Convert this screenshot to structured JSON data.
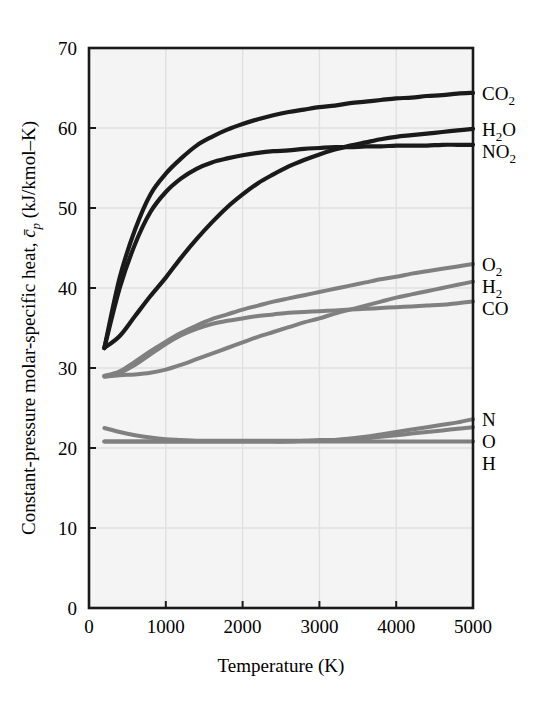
{
  "figure": {
    "background_color": "#ffffff",
    "plot_background_color": "#f4f4f4",
    "grid_color": "#e0e0e0",
    "axis_color": "#1a1a1a",
    "dark_series_color": "#1a1a1a",
    "gray_series_color": "#808080"
  },
  "axes": {
    "x_title": "Temperature (K)",
    "y_title_part1": "Constant-pressure molar-specific heat, ",
    "y_title_symbol": "c̄",
    "y_title_sub": "p",
    "y_title_part2": " (kJ/kmol–K)",
    "x_ticks": [
      "0",
      "1000",
      "2000",
      "3000",
      "4000",
      "5000"
    ],
    "y_ticks": [
      "0",
      "10",
      "20",
      "30",
      "40",
      "50",
      "60",
      "70"
    ]
  },
  "chart_data": {
    "type": "line",
    "title": "",
    "xlabel": "Temperature (K)",
    "ylabel": "Constant-pressure molar-specific heat, c̄p (kJ/kmol–K)",
    "xlim": [
      0,
      5000
    ],
    "ylim": [
      0,
      70
    ],
    "grid": true,
    "legend_position": "right-inline-labels",
    "x": [
      200,
      400,
      600,
      800,
      1000,
      1200,
      1400,
      1600,
      1800,
      2000,
      2200,
      2400,
      2600,
      2800,
      3000,
      3200,
      3400,
      3600,
      3800,
      4000,
      4200,
      4400,
      4600,
      4800,
      5000
    ],
    "series": [
      {
        "name": "CO2",
        "label": "CO",
        "label_sub": "2",
        "color": "#1a1a1a",
        "values": [
          32.5,
          41.3,
          47.3,
          51.7,
          54.3,
          56.2,
          57.8,
          58.9,
          59.8,
          60.5,
          61.1,
          61.6,
          62.0,
          62.3,
          62.6,
          62.8,
          63.1,
          63.3,
          63.5,
          63.7,
          63.8,
          64.0,
          64.1,
          64.3,
          64.4
        ]
      },
      {
        "name": "H2O",
        "label": "H",
        "label_sub": "2",
        "label_tail": "O",
        "color": "#1a1a1a",
        "values": [
          32.5,
          34.0,
          36.5,
          39.0,
          41.3,
          43.8,
          46.1,
          48.2,
          50.1,
          51.7,
          53.1,
          54.2,
          55.2,
          56.0,
          56.7,
          57.3,
          57.8,
          58.2,
          58.6,
          58.9,
          59.1,
          59.3,
          59.5,
          59.7,
          59.9
        ]
      },
      {
        "name": "NO2",
        "label": "NO",
        "label_sub": "2",
        "color": "#1a1a1a",
        "values": [
          32.5,
          40.0,
          45.5,
          49.5,
          52.0,
          53.7,
          54.9,
          55.7,
          56.2,
          56.6,
          56.9,
          57.1,
          57.2,
          57.4,
          57.5,
          57.6,
          57.6,
          57.7,
          57.7,
          57.8,
          57.8,
          57.8,
          57.9,
          57.9,
          57.9
        ]
      },
      {
        "name": "O2",
        "label": "O",
        "label_sub": "2",
        "color": "#808080",
        "values": [
          29.0,
          29.6,
          30.8,
          32.1,
          33.3,
          34.4,
          35.3,
          36.1,
          36.7,
          37.3,
          37.8,
          38.3,
          38.7,
          39.1,
          39.5,
          39.9,
          40.3,
          40.7,
          41.1,
          41.4,
          41.8,
          42.1,
          42.4,
          42.7,
          43.0
        ]
      },
      {
        "name": "H2",
        "label": "H",
        "label_sub": "2",
        "color": "#808080",
        "values": [
          28.9,
          29.1,
          29.2,
          29.4,
          29.8,
          30.4,
          31.1,
          31.8,
          32.5,
          33.2,
          33.9,
          34.5,
          35.1,
          35.7,
          36.2,
          36.8,
          37.3,
          37.8,
          38.3,
          38.8,
          39.2,
          39.6,
          40.0,
          40.4,
          40.8
        ]
      },
      {
        "name": "CO",
        "label": "CO",
        "color": "#808080",
        "values": [
          29.0,
          29.4,
          30.4,
          31.7,
          33.0,
          34.1,
          34.9,
          35.5,
          35.9,
          36.2,
          36.5,
          36.7,
          36.9,
          37.0,
          37.1,
          37.2,
          37.3,
          37.4,
          37.5,
          37.6,
          37.7,
          37.8,
          37.9,
          38.1,
          38.3
        ]
      },
      {
        "name": "N",
        "label": "N",
        "color": "#808080",
        "values": [
          20.8,
          20.8,
          20.8,
          20.8,
          20.8,
          20.8,
          20.8,
          20.8,
          20.8,
          20.8,
          20.8,
          20.8,
          20.8,
          20.9,
          20.9,
          21.0,
          21.2,
          21.4,
          21.7,
          22.0,
          22.3,
          22.6,
          22.9,
          23.2,
          23.6
        ]
      },
      {
        "name": "O",
        "label": "O",
        "color": "#808080",
        "values": [
          22.5,
          22.0,
          21.6,
          21.3,
          21.1,
          21.0,
          20.9,
          20.9,
          20.9,
          20.9,
          20.9,
          20.9,
          20.9,
          20.9,
          21.0,
          21.0,
          21.1,
          21.2,
          21.4,
          21.6,
          21.8,
          22.0,
          22.2,
          22.4,
          22.6
        ]
      },
      {
        "name": "H",
        "label": "H",
        "color": "#808080",
        "values": [
          20.8,
          20.8,
          20.8,
          20.8,
          20.8,
          20.8,
          20.8,
          20.8,
          20.8,
          20.8,
          20.8,
          20.8,
          20.8,
          20.8,
          20.8,
          20.8,
          20.8,
          20.8,
          20.8,
          20.8,
          20.8,
          20.8,
          20.8,
          20.8,
          20.8
        ]
      }
    ],
    "right_labels": [
      {
        "name": "CO2",
        "text": "CO",
        "sub": "2",
        "value": 64.4
      },
      {
        "name": "H2O",
        "text": "H",
        "sub": "2",
        "tail": "O",
        "value": 59.9
      },
      {
        "name": "NO2",
        "text": "NO",
        "sub": "2",
        "value": 57.9
      },
      {
        "name": "O2",
        "text": "O",
        "sub": "2",
        "value": 43.0
      },
      {
        "name": "H2",
        "text": "H",
        "sub": "2",
        "value": 40.8
      },
      {
        "name": "CO",
        "text": "CO",
        "value": 38.3
      },
      {
        "name": "N",
        "text": "N",
        "value": 23.6
      },
      {
        "name": "O",
        "text": "O",
        "value": 22.6
      },
      {
        "name": "H",
        "text": "H",
        "value": 20.8
      }
    ]
  }
}
